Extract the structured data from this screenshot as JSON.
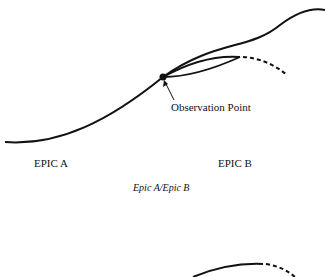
{
  "diagram": {
    "annotation": "Observation Point",
    "left_label": "EPIC A",
    "right_label": "EPIC B",
    "caption": "Epic A/Epic B",
    "stroke_color": "#111111"
  }
}
